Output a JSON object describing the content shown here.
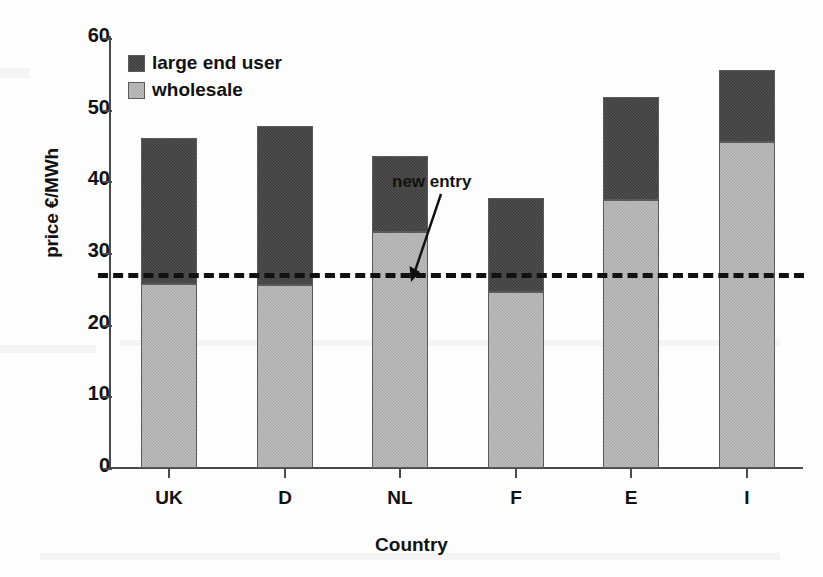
{
  "chart_data": {
    "type": "bar",
    "stacked": true,
    "title": "",
    "xlabel": "Country",
    "ylabel": "price €/MWh",
    "categories": [
      "UK",
      "D",
      "NL",
      "F",
      "E",
      "I"
    ],
    "series": [
      {
        "name": "wholesale",
        "color": "#a8a8a8",
        "values": [
          25.7,
          25.5,
          33.0,
          24.6,
          37.4,
          45.5
        ]
      },
      {
        "name": "large end user",
        "color": "#3a3a3a",
        "values": [
          20.3,
          22.2,
          10.6,
          13.1,
          14.4,
          10.1
        ]
      }
    ],
    "totals": [
      46.0,
      47.7,
      43.6,
      37.7,
      51.8,
      55.6
    ],
    "ylim": [
      0,
      60
    ],
    "yticks": [
      0,
      10,
      20,
      30,
      40,
      50,
      60
    ],
    "ytick_labels": [
      "0",
      "10",
      "20",
      "30",
      "40",
      "50",
      "60"
    ],
    "grid": false,
    "legend_position": "top-left",
    "legend_entries": [
      "large end user",
      "wholesale"
    ],
    "reference_line": {
      "label": "new entry",
      "value": 26.5,
      "style": "dashed",
      "color": "#111111"
    },
    "annotations": [
      {
        "text": "new entry",
        "target_value": 26.5,
        "target_category": "F"
      }
    ]
  },
  "legend": {
    "items": [
      {
        "label": "large end user",
        "swatch": "dark-swatch"
      },
      {
        "label": "wholesale",
        "swatch": "light-swatch"
      }
    ]
  },
  "axes": {
    "y": {
      "title": "price €/MWh",
      "ticks": [
        "60",
        "50",
        "40",
        "30",
        "20",
        "10",
        "0"
      ]
    },
    "x": {
      "title": "Country",
      "ticks": [
        "UK",
        "D",
        "NL",
        "F",
        "E",
        "I"
      ]
    }
  },
  "annotation": {
    "new_entry_label": "new entry"
  }
}
